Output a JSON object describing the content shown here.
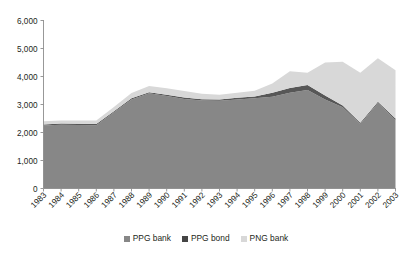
{
  "chart_data": {
    "type": "area",
    "stacked": true,
    "title": "",
    "subtitle": "",
    "xlabel": "",
    "ylabel": "",
    "categories": [
      "1983",
      "1984",
      "1985",
      "1986",
      "1987",
      "1988",
      "1989",
      "1990",
      "1991",
      "1992",
      "1993",
      "1994",
      "1995",
      "1996",
      "1997",
      "1998",
      "1999",
      "2000",
      "2001",
      "2002",
      "2003"
    ],
    "x": [
      1983,
      1984,
      1985,
      1986,
      1987,
      1988,
      1989,
      1990,
      1991,
      1992,
      1993,
      1994,
      1995,
      1996,
      1997,
      1998,
      1999,
      2000,
      2001,
      2002,
      2003
    ],
    "series": [
      {
        "name": "PPG bank",
        "color": "#878787",
        "values": [
          2250,
          2280,
          2270,
          2260,
          2720,
          3180,
          3400,
          3300,
          3200,
          3140,
          3130,
          3180,
          3220,
          3280,
          3420,
          3520,
          3180,
          2900,
          2300,
          3050,
          2450
        ]
      },
      {
        "name": "PPG bond",
        "color": "#575757",
        "values": [
          40,
          40,
          40,
          40,
          40,
          40,
          40,
          50,
          50,
          50,
          50,
          60,
          70,
          140,
          170,
          180,
          140,
          60,
          50,
          50,
          50
        ]
      },
      {
        "name": "PNG bank",
        "color": "#d8d8d8",
        "values": [
          110,
          110,
          120,
          130,
          150,
          190,
          220,
          230,
          230,
          190,
          170,
          180,
          200,
          330,
          600,
          430,
          1180,
          1570,
          1780,
          1550,
          1720
        ]
      }
    ],
    "totals": [
      2400,
      2430,
      2430,
      2430,
      2910,
      3410,
      3660,
      3580,
      3480,
      3380,
      3350,
      3420,
      3490,
      3750,
      4190,
      4130,
      4500,
      4530,
      4130,
      4650,
      4220
    ],
    "ylim": [
      0,
      6000
    ],
    "yticks": [
      0,
      1000,
      2000,
      3000,
      4000,
      5000,
      6000
    ],
    "ytick_labels": [
      "0",
      "1,000",
      "2,000",
      "3,000",
      "4,000",
      "5,000",
      "6,000"
    ],
    "grid": false,
    "legend_position": "bottom"
  },
  "legend": {
    "items": [
      {
        "label": "PPG bank",
        "color": "#878787"
      },
      {
        "label": "PPG bond",
        "color": "#454545"
      },
      {
        "label": "PNG bank",
        "color": "#d8d8d8"
      }
    ]
  },
  "axes": {
    "y_labels": [
      "6,000",
      "5,000",
      "4,000",
      "3,000",
      "2,000",
      "1,000",
      "0"
    ],
    "x_labels": [
      "1983",
      "1984",
      "1985",
      "1986",
      "1987",
      "1988",
      "1989",
      "1990",
      "1991",
      "1992",
      "1993",
      "1994",
      "1995",
      "1996",
      "1997",
      "1998",
      "1999",
      "2000",
      "2001",
      "2002",
      "2003"
    ]
  }
}
